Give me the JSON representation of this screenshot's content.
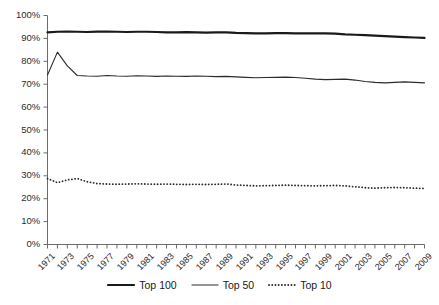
{
  "chart_data": {
    "type": "line",
    "title": "",
    "xlabel": "",
    "ylabel": "",
    "xlim": [
      1971,
      2009
    ],
    "ylim": [
      0,
      100
    ],
    "grid": false,
    "legend_position": "bottom",
    "y_ticks": [
      "0%",
      "10%",
      "20%",
      "30%",
      "40%",
      "50%",
      "60%",
      "70%",
      "80%",
      "90%",
      "100%"
    ],
    "y_tick_values": [
      0,
      10,
      20,
      30,
      40,
      50,
      60,
      70,
      80,
      90,
      100
    ],
    "x": [
      1971,
      1972,
      1973,
      1974,
      1975,
      1976,
      1977,
      1978,
      1979,
      1980,
      1981,
      1982,
      1983,
      1984,
      1985,
      1986,
      1987,
      1988,
      1989,
      1990,
      1991,
      1992,
      1993,
      1994,
      1995,
      1996,
      1997,
      1998,
      1999,
      2000,
      2001,
      2002,
      2003,
      2004,
      2005,
      2006,
      2007,
      2008,
      2009
    ],
    "x_tick_labels": [
      "1971",
      "1973",
      "1975",
      "1977",
      "1979",
      "1981",
      "1983",
      "1985",
      "1987",
      "1989",
      "1991",
      "1993",
      "1995",
      "1997",
      "1999",
      "2001",
      "2003",
      "2005",
      "2007",
      "2009"
    ],
    "x_tick_label_values": [
      1971,
      1973,
      1975,
      1977,
      1979,
      1981,
      1983,
      1985,
      1987,
      1989,
      1991,
      1993,
      1995,
      1997,
      1999,
      2001,
      2003,
      2005,
      2007,
      2009
    ],
    "series": [
      {
        "name": "Top 100",
        "style": "solid-thick",
        "color": "#1a1a1a",
        "width": 2.2,
        "values": [
          92.6,
          92.9,
          93.0,
          92.9,
          92.8,
          93.0,
          93.0,
          92.9,
          92.8,
          92.9,
          92.9,
          92.8,
          92.6,
          92.6,
          92.7,
          92.6,
          92.5,
          92.6,
          92.6,
          92.4,
          92.3,
          92.2,
          92.2,
          92.3,
          92.3,
          92.2,
          92.2,
          92.2,
          92.2,
          92.1,
          91.8,
          91.6,
          91.4,
          91.2,
          91.0,
          90.8,
          90.6,
          90.4,
          90.2
        ]
      },
      {
        "name": "Top 50",
        "style": "solid-thin",
        "color": "#2b2b2b",
        "width": 1.1,
        "values": [
          74.0,
          84.0,
          78.0,
          73.8,
          73.6,
          73.5,
          73.8,
          73.6,
          73.5,
          73.7,
          73.6,
          73.4,
          73.6,
          73.5,
          73.4,
          73.6,
          73.5,
          73.3,
          73.4,
          73.2,
          73.0,
          72.8,
          72.9,
          73.0,
          73.1,
          72.9,
          72.6,
          72.2,
          72.0,
          72.1,
          72.2,
          71.8,
          71.2,
          70.8,
          70.6,
          70.8,
          71.0,
          70.8,
          70.6
        ]
      },
      {
        "name": "Top 10",
        "style": "dotted",
        "color": "#2b2b2b",
        "width": 1.8,
        "values": [
          28.8,
          27.0,
          28.2,
          28.8,
          27.4,
          26.6,
          26.4,
          26.3,
          26.4,
          26.5,
          26.4,
          26.3,
          26.4,
          26.3,
          26.2,
          26.3,
          26.2,
          26.3,
          26.4,
          26.0,
          25.8,
          25.6,
          25.7,
          25.8,
          25.9,
          25.8,
          25.7,
          25.6,
          25.7,
          25.8,
          25.6,
          25.2,
          24.8,
          24.6,
          24.8,
          24.9,
          24.8,
          24.6,
          24.5
        ]
      }
    ]
  },
  "legend": {
    "entries": [
      {
        "label": "Top 100",
        "swatch": "solid-thick-line-swatch"
      },
      {
        "label": "Top 50",
        "swatch": "solid-thin-line-swatch"
      },
      {
        "label": "Top 10",
        "swatch": "dotted-line-swatch"
      }
    ]
  }
}
